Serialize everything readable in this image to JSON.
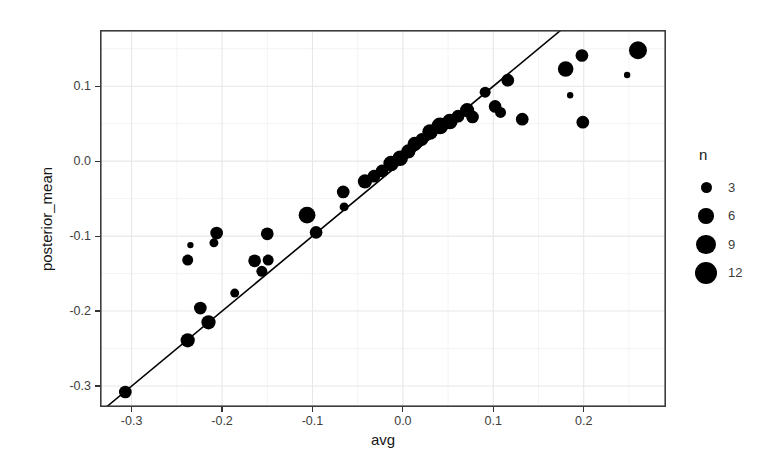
{
  "figure": {
    "background": "#ffffff",
    "panel_border_color": "#3c3c3c",
    "grid_major_color": "#e7e7e7",
    "grid_minor_color": "#f3f3f3",
    "tick_color": "#333333",
    "tick_label_color": "#3d3d3d",
    "axis_title_color": "#161616"
  },
  "chart_data": {
    "type": "scatter",
    "title": "",
    "xlabel": "avg",
    "ylabel": "posterior_mean",
    "x_ticks": [
      "-0.3",
      "-0.2",
      "-0.1",
      "0.0",
      "0.1",
      "0.2"
    ],
    "y_ticks": [
      "0.1",
      "0.0",
      "-0.1",
      "-0.2",
      "-0.3"
    ],
    "xlim": [
      -0.335,
      0.291
    ],
    "ylim": [
      -0.328,
      0.175
    ],
    "grid": true,
    "point_color": "#000000",
    "reference_line": {
      "type": "identity",
      "slope": 1,
      "intercept": 0,
      "color": "#000000",
      "width_px": 1.6
    },
    "legend": {
      "title": "n",
      "breaks": [
        3,
        6,
        9,
        12
      ],
      "max_break": 12,
      "max_radius_px": 11,
      "position": "right"
    },
    "points": [
      {
        "avg": -0.307,
        "posterior_mean": -0.308,
        "n": 4
      },
      {
        "avg": -0.238,
        "posterior_mean": -0.239,
        "n": 5
      },
      {
        "avg": -0.215,
        "posterior_mean": -0.215,
        "n": 5
      },
      {
        "avg": -0.224,
        "posterior_mean": -0.196,
        "n": 4
      },
      {
        "avg": -0.186,
        "posterior_mean": -0.176,
        "n": 2
      },
      {
        "avg": -0.235,
        "posterior_mean": -0.112,
        "n": 1
      },
      {
        "avg": -0.238,
        "posterior_mean": -0.132,
        "n": 3
      },
      {
        "avg": -0.206,
        "posterior_mean": -0.096,
        "n": 4
      },
      {
        "avg": -0.209,
        "posterior_mean": -0.109,
        "n": 2
      },
      {
        "avg": -0.15,
        "posterior_mean": -0.097,
        "n": 4
      },
      {
        "avg": -0.164,
        "posterior_mean": -0.133,
        "n": 4
      },
      {
        "avg": -0.149,
        "posterior_mean": -0.132,
        "n": 3
      },
      {
        "avg": -0.156,
        "posterior_mean": -0.147,
        "n": 3
      },
      {
        "avg": -0.106,
        "posterior_mean": -0.072,
        "n": 7
      },
      {
        "avg": -0.096,
        "posterior_mean": -0.095,
        "n": 4
      },
      {
        "avg": -0.065,
        "posterior_mean": -0.061,
        "n": 2
      },
      {
        "avg": -0.066,
        "posterior_mean": -0.041,
        "n": 4
      },
      {
        "avg": -0.042,
        "posterior_mean": -0.027,
        "n": 5
      },
      {
        "avg": -0.032,
        "posterior_mean": -0.02,
        "n": 4
      },
      {
        "avg": -0.023,
        "posterior_mean": -0.013,
        "n": 4
      },
      {
        "avg": -0.013,
        "posterior_mean": -0.003,
        "n": 6
      },
      {
        "avg": -0.003,
        "posterior_mean": 0.004,
        "n": 6
      },
      {
        "avg": 0.006,
        "posterior_mean": 0.013,
        "n": 5
      },
      {
        "avg": 0.013,
        "posterior_mean": 0.023,
        "n": 5
      },
      {
        "avg": 0.021,
        "posterior_mean": 0.029,
        "n": 4
      },
      {
        "avg": 0.03,
        "posterior_mean": 0.039,
        "n": 6
      },
      {
        "avg": 0.041,
        "posterior_mean": 0.047,
        "n": 7
      },
      {
        "avg": 0.052,
        "posterior_mean": 0.053,
        "n": 6
      },
      {
        "avg": 0.061,
        "posterior_mean": 0.06,
        "n": 4
      },
      {
        "avg": 0.071,
        "posterior_mean": 0.068,
        "n": 5
      },
      {
        "avg": 0.077,
        "posterior_mean": 0.059,
        "n": 4
      },
      {
        "avg": 0.091,
        "posterior_mean": 0.092,
        "n": 3
      },
      {
        "avg": 0.102,
        "posterior_mean": 0.073,
        "n": 4
      },
      {
        "avg": 0.108,
        "posterior_mean": 0.065,
        "n": 3
      },
      {
        "avg": 0.116,
        "posterior_mean": 0.108,
        "n": 4
      },
      {
        "avg": 0.132,
        "posterior_mean": 0.056,
        "n": 4
      },
      {
        "avg": 0.18,
        "posterior_mean": 0.123,
        "n": 6
      },
      {
        "avg": 0.198,
        "posterior_mean": 0.141,
        "n": 4
      },
      {
        "avg": 0.26,
        "posterior_mean": 0.148,
        "n": 8
      },
      {
        "avg": 0.248,
        "posterior_mean": 0.115,
        "n": 1
      },
      {
        "avg": 0.185,
        "posterior_mean": 0.088,
        "n": 1
      },
      {
        "avg": 0.199,
        "posterior_mean": 0.052,
        "n": 4
      }
    ]
  }
}
